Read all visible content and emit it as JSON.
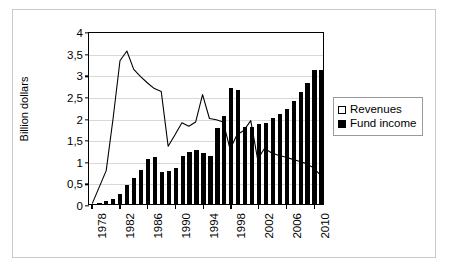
{
  "figure": {
    "ylabel": "Billion dollars",
    "legend": {
      "position": "right",
      "entries": [
        {
          "label": "Revenues",
          "marker": "open-square",
          "color": "#ffffff"
        },
        {
          "label": "Fund income",
          "marker": "filled-square",
          "color": "#000000"
        }
      ]
    }
  },
  "chart_data": {
    "type": "bar",
    "title": "",
    "subtitle": "",
    "xlabel": "",
    "ylabel": "Billion dollars",
    "ylim": [
      0,
      4
    ],
    "ytick_labels": [
      "0",
      "0,5",
      "1",
      "1,5",
      "2",
      "2,5",
      "3",
      "3,5",
      "4"
    ],
    "ytick_values": [
      0,
      0.5,
      1,
      1.5,
      2,
      2.5,
      3,
      3.5,
      4
    ],
    "grid": true,
    "legend_position": "right",
    "categories": [
      "1978",
      "1979",
      "1980",
      "1981",
      "1982",
      "1983",
      "1984",
      "1985",
      "1986",
      "1987",
      "1988",
      "1989",
      "1990",
      "1991",
      "1992",
      "1993",
      "1994",
      "1995",
      "1996",
      "1997",
      "1998",
      "1999",
      "2000",
      "2001",
      "2002",
      "2003",
      "2004",
      "2005",
      "2006",
      "2007",
      "2008",
      "2009",
      "2010",
      "2011"
    ],
    "xtick_labels": [
      "1978",
      "1982",
      "1986",
      "1990",
      "1994",
      "1998",
      "2002",
      "2006",
      "2010"
    ],
    "series": [
      {
        "name": "Revenues",
        "type": "line",
        "color": "#000000",
        "values": [
          0.02,
          0.4,
          0.78,
          2.0,
          3.35,
          3.58,
          3.15,
          2.98,
          2.83,
          2.7,
          2.63,
          1.35,
          1.62,
          1.9,
          1.82,
          1.92,
          2.56,
          2.0,
          1.97,
          1.92,
          1.28,
          1.62,
          1.72,
          1.95,
          1.05,
          1.3,
          1.2,
          1.14,
          1.1,
          1.05,
          1.0,
          0.95,
          0.86,
          0.7
        ]
      },
      {
        "name": "Fund income",
        "type": "bar",
        "color": "#000000",
        "values": [
          0.01,
          0.02,
          0.06,
          0.12,
          0.24,
          0.44,
          0.6,
          0.79,
          1.03,
          1.08,
          0.74,
          0.76,
          0.83,
          1.12,
          1.2,
          1.24,
          1.19,
          1.12,
          1.76,
          2.04,
          2.68,
          2.63,
          1.78,
          1.79,
          1.86,
          1.88,
          1.99,
          2.08,
          2.2,
          2.38,
          2.58,
          2.8,
          3.1,
          3.1
        ]
      }
    ]
  }
}
